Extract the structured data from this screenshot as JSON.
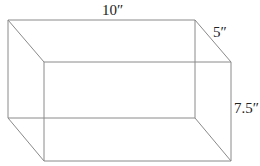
{
  "diagram": {
    "type": "rectangular-prism",
    "colors": {
      "edge": "#8a8a8a",
      "label": "#222222",
      "background": "#ffffff"
    },
    "labels": {
      "length": "10″",
      "depth": "5″",
      "height": "7.5″"
    },
    "dimensions": {
      "length": 10,
      "depth": 5,
      "height": 7.5,
      "unit": "in"
    }
  }
}
